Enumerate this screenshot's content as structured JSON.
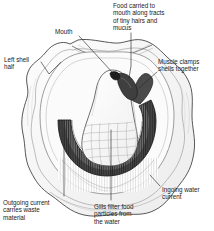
{
  "figure": {
    "background_color": "#ffffff",
    "ink_color": "#222222",
    "width": 214,
    "height": 231
  },
  "labels": {
    "food": "Food carried to\nmouth along tracts\nof tiny hairs and\nmucus",
    "mouth": "Mouth",
    "left_shell": "Left shell\nhalf",
    "muscle": "Muscle clamps\nshells together",
    "ingoing": "Ingoing water\ncurrent",
    "gills": "Gills filter food\nparticles from\nthe water",
    "outgoing": "Outgoing current\ncarries waste\nmaterial"
  },
  "artwork": {
    "shell_outline": "left-shell-half-outline",
    "mantle": "mantle-tissue",
    "visceral_mass": "visceral-mass",
    "gills": "gill-crescent",
    "muscle": "adductor-muscle",
    "mouth": "mouth-opening",
    "hinge": "shell-hinge"
  }
}
